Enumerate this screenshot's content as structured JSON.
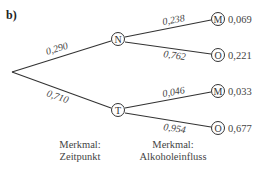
{
  "title": "b)",
  "tree": {
    "level1": [
      {
        "node": "N",
        "prob": "0,290"
      },
      {
        "node": "T",
        "prob": "0,710"
      }
    ],
    "level2": [
      {
        "parent": "N",
        "node": "M",
        "prob": "0,238",
        "result": "0,069"
      },
      {
        "parent": "N",
        "node": "O",
        "prob": "0,762",
        "result": "0,221"
      },
      {
        "parent": "T",
        "node": "M",
        "prob": "0,046",
        "result": "0,033"
      },
      {
        "parent": "T",
        "node": "O",
        "prob": "0,954",
        "result": "0,677"
      }
    ]
  },
  "captions": {
    "level1": {
      "line1": "Merkmal:",
      "line2": "Zeitpunkt"
    },
    "level2": {
      "line1": "Merkmal:",
      "line2": "Alkoholeinfluss"
    }
  }
}
